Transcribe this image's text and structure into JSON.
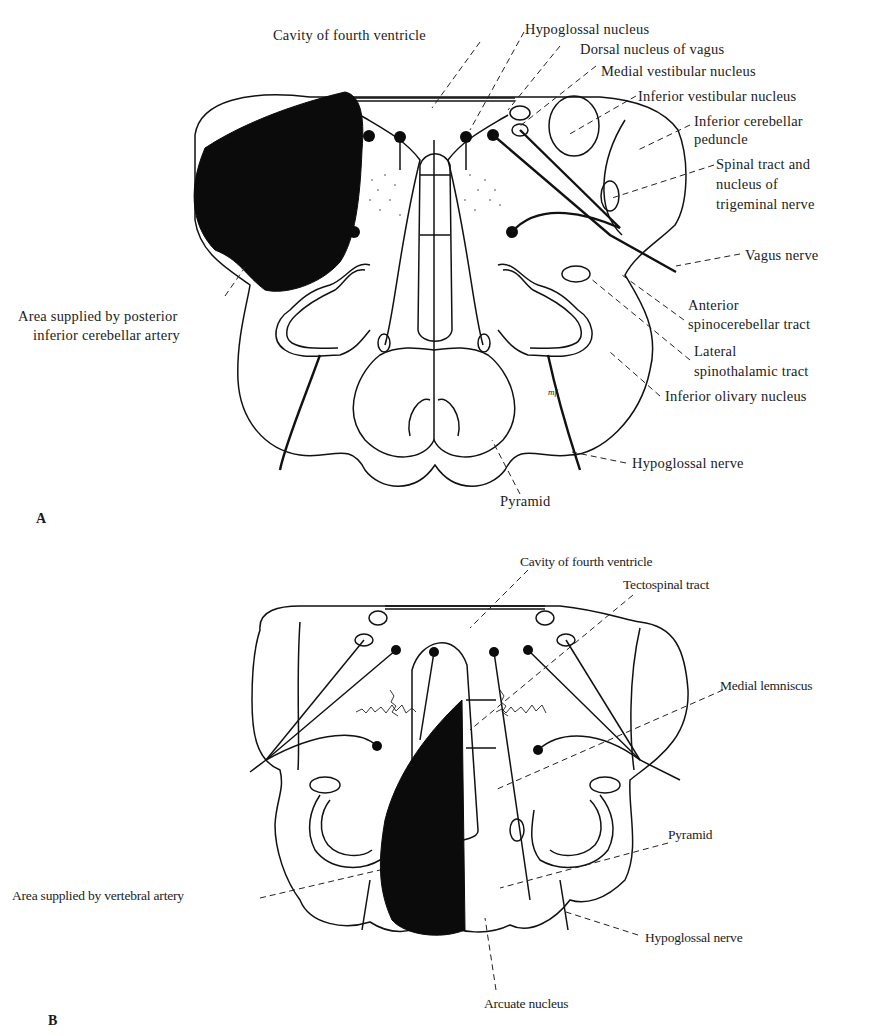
{
  "figure": {
    "panels": [
      {
        "id": "A",
        "panel_label": "A",
        "labels": {
          "cavity": "Cavity of fourth ventricle",
          "hypoglossal_nucleus": "Hypoglossal nucleus",
          "dorsal_vagus": "Dorsal nucleus of vagus",
          "medial_vestibular": "Medial vestibular nucleus",
          "inferior_vestibular": "Inferior vestibular nucleus",
          "icp_1": "Inferior cerebellar",
          "icp_2": "peduncle",
          "trig_1": "Spinal tract and",
          "trig_2": "nucleus of",
          "trig_3": "trigeminal nerve",
          "vagus_nerve": "Vagus nerve",
          "asct_1": "Anterior",
          "asct_2": "spinocerebellar tract",
          "lst_1": "Lateral",
          "lst_2": "spinothalamic tract",
          "olivary": "Inferior olivary nucleus",
          "hypoglossal_nerve": "Hypoglossal nerve",
          "pyramid": "Pyramid",
          "pica_1": "Area supplied by posterior",
          "pica_2": "inferior cerebellar artery"
        }
      },
      {
        "id": "B",
        "panel_label": "B",
        "labels": {
          "cavity": "Cavity of fourth ventricle",
          "tectospinal": "Tectospinal tract",
          "medial_lemniscus": "Medial lemniscus",
          "pyramid": "Pyramid",
          "vertebral": "Area supplied by vertebral artery",
          "hypoglossal_nerve": "Hypoglossal nerve",
          "arcuate": "Arcuate nucleus"
        }
      }
    ],
    "signature": "mf",
    "colors": {
      "ink": "#111111",
      "lesion_fill": "#0b0b0b",
      "background": "#ffffff"
    }
  }
}
